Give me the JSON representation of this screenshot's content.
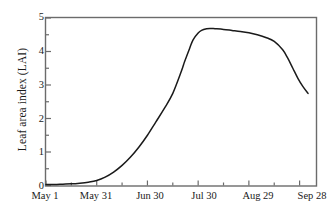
{
  "chart_data": {
    "type": "line",
    "title": "",
    "xlabel": "",
    "ylabel": "Leaf area index (LAI)",
    "ylim": [
      0,
      5
    ],
    "xlim": [
      0,
      160
    ],
    "grid": false,
    "legend": "none",
    "x_unit": "days since May 1",
    "x_tick_labels": [
      "May 1",
      "May 31",
      "Jun 30",
      "Jul 30",
      "Aug 29",
      "Sep 28"
    ],
    "x_tick_values": [
      0,
      30,
      60,
      90,
      120,
      150
    ],
    "x_minor_tick_values": [
      15,
      45,
      75,
      105,
      135
    ],
    "y_tick_labels": [
      "0",
      "1",
      "2",
      "3",
      "4",
      "5"
    ],
    "y_tick_values": [
      0,
      1,
      2,
      3,
      4,
      5
    ],
    "y_minor_tick_values": [
      0.5,
      1.5,
      2.5,
      3.5,
      4.5
    ],
    "series": [
      {
        "name": "Leaf area index",
        "color": "#1a1a1a",
        "x": [
          0,
          5,
          10,
          15,
          20,
          25,
          30,
          35,
          40,
          45,
          50,
          55,
          60,
          65,
          70,
          75,
          80,
          82,
          85,
          87,
          90,
          92,
          95,
          97,
          100,
          105,
          110,
          115,
          120,
          125,
          130,
          135,
          140,
          143,
          146,
          149,
          152,
          155
        ],
        "y": [
          0.03,
          0.03,
          0.04,
          0.05,
          0.07,
          0.1,
          0.15,
          0.25,
          0.4,
          0.6,
          0.85,
          1.15,
          1.5,
          1.9,
          2.3,
          2.75,
          3.4,
          3.7,
          4.1,
          4.35,
          4.55,
          4.63,
          4.68,
          4.69,
          4.68,
          4.66,
          4.63,
          4.6,
          4.56,
          4.5,
          4.42,
          4.3,
          4.05,
          3.8,
          3.5,
          3.2,
          2.95,
          2.75
        ]
      }
    ]
  },
  "axes": {
    "y_title": "Leaf area index (LAI)",
    "y_ticks": [
      "5",
      "4",
      "3",
      "2",
      "1",
      "0"
    ],
    "x_ticks": [
      "May 1",
      "May 31",
      "Jun 30",
      "Jul 30",
      "Aug 29",
      "Sep 28"
    ]
  },
  "style": {
    "line_color": "#1a1a1a",
    "axis_color": "#6b6b6b",
    "background": "#ffffff"
  }
}
